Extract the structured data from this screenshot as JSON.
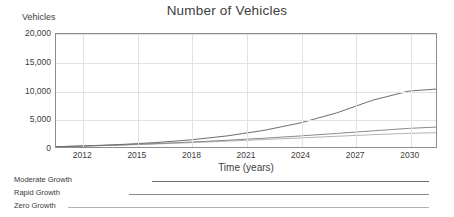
{
  "chart_data": {
    "type": "line",
    "title": "Number of Vehicles",
    "xlabel": "Time (years)",
    "ylabel": "Vehicles",
    "grid": true,
    "legend_position": "below",
    "xlim": [
      2010.5,
      2031.5
    ],
    "ylim": [
      0,
      20000
    ],
    "xticks": [
      "2012",
      "2015",
      "2018",
      "2021",
      "2024",
      "2027",
      "2030"
    ],
    "xtick_values": [
      2012,
      2015,
      2018,
      2021,
      2024,
      2027,
      2030
    ],
    "yticks": [
      "0",
      "5,000",
      "10,000",
      "15,000",
      "20,000"
    ],
    "ytick_values": [
      0,
      5000,
      10000,
      15000,
      20000
    ],
    "x": [
      2010.5,
      2012,
      2014,
      2016,
      2018,
      2020,
      2022,
      2024,
      2026,
      2028,
      2030,
      2031.5
    ],
    "series": [
      {
        "name": "Moderate Growth",
        "color": "#6e6e6e",
        "values": [
          60,
          190,
          430,
          780,
          1280,
          1980,
          2950,
          4260,
          6020,
          8280,
          9900,
          10250
        ]
      },
      {
        "name": "Rapid Growth",
        "color": "#8a8a8a",
        "values": [
          55,
          170,
          360,
          600,
          880,
          1200,
          1560,
          1960,
          2400,
          2860,
          3300,
          3520
        ]
      },
      {
        "name": "Zero Growth",
        "color": "#b2b2b2",
        "values": [
          50,
          150,
          320,
          540,
          780,
          1040,
          1320,
          1600,
          1900,
          2180,
          2420,
          2530
        ]
      }
    ]
  },
  "legend": {
    "rows": [
      {
        "label": "Moderate Growth",
        "color": "#6e6e6e",
        "start_pct": 33.5,
        "end_pct": 94.5
      },
      {
        "label": "Rapid Growth",
        "color": "#8a8a8a",
        "start_pct": 28.5,
        "end_pct": 94.5
      },
      {
        "label": "Zero Growth",
        "color": "#b2b2b2",
        "start_pct": 15.0,
        "end_pct": 94.5
      }
    ]
  }
}
